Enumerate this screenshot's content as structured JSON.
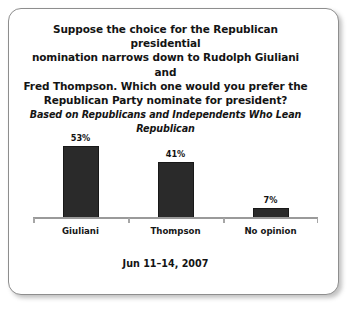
{
  "chart_data": {
    "type": "bar",
    "title": "Suppose the choice for the Republican presidential nomination narrows down to Rudolph Giuliani and Fred Thompson. Which one would you prefer the Republican Party nominate for president?",
    "title_lines": [
      "Suppose the choice for the Republican presidential",
      "nomination narrows down to Rudolph Giuliani and",
      "Fred Thompson. Which one would you prefer the",
      "Republican Party nominate for president?"
    ],
    "subtitle": "Based on Republicans and Independents Who Lean Republican",
    "categories": [
      "Giuliani",
      "Thompson",
      "No opinion"
    ],
    "values": [
      53,
      41,
      7
    ],
    "value_labels": [
      "53%",
      "41%",
      "7%"
    ],
    "xlabel": "",
    "ylabel": "",
    "ylim": [
      0,
      72
    ],
    "grid": false,
    "legend": "none",
    "footnote": "Jun 11–14, 2007",
    "bar_color": "#2a2a2a",
    "axis_color": "#9a9a9a",
    "background_color": "#ffffff"
  }
}
